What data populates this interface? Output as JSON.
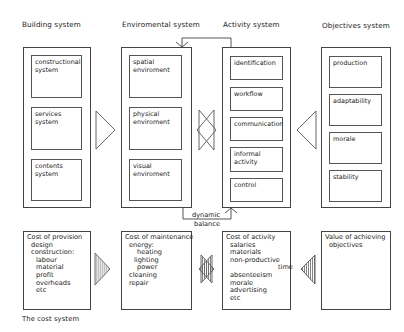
{
  "systems": {
    "building": {
      "title": "Building system",
      "items": [
        "constructional system",
        "services system",
        "contents system"
      ]
    },
    "environmental": {
      "title": "Enviromental system",
      "items": [
        "spatial enviroment",
        "physical enviroment",
        "visual enviroment"
      ]
    },
    "activity": {
      "title": "Activity system",
      "items": [
        "identification",
        "workflow",
        "communication",
        "informal activity",
        "control"
      ]
    },
    "objectives": {
      "title": "Objectives system",
      "items": [
        "production",
        "adaptability",
        "morale",
        "stability"
      ]
    }
  },
  "connector": {
    "dynamic": "dynamic",
    "balance": "balance"
  },
  "cost_system": {
    "label": "The cost system",
    "provision": {
      "title": "Cost of provision",
      "items": [
        "design",
        "construction:",
        "labour",
        "material",
        "profit",
        "overheads",
        "etc"
      ]
    },
    "maintenance": {
      "title": "Cost of maintenance",
      "items": [
        "energy:",
        "heating",
        "lighting",
        "power",
        "cleaning",
        "repair"
      ]
    },
    "activity": {
      "title": "Cost of activity",
      "items": [
        "salaries",
        "materials",
        "non-productive",
        "time",
        "absenteeism",
        "morale",
        "advertising",
        "etc"
      ]
    },
    "value": {
      "title": "Value of achieving",
      "title2": "objectives"
    }
  },
  "colors": {
    "line": "#444444",
    "hatch": "#666666",
    "fill_light": "#e4e4e4"
  }
}
